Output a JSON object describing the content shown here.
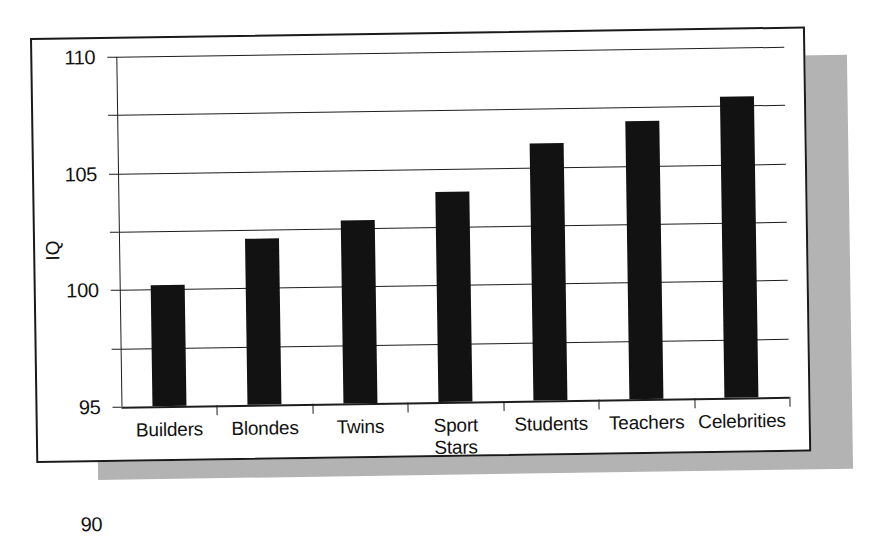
{
  "figure": {
    "frame_color": "#1a1a1a",
    "shadow_color": "#b3b3b3",
    "background": "#ffffff",
    "bar_color": "#121212"
  },
  "chart_data": {
    "type": "bar",
    "title": "",
    "subtitle": "",
    "xlabel": "",
    "ylabel": "IQ",
    "categories": [
      "Builders",
      "Blondes",
      "Twins",
      "Sport\nStars",
      "Students",
      "Teachers",
      "Celebrities"
    ],
    "values": [
      90.4,
      94.2,
      95.7,
      98.0,
      102.0,
      103.8,
      105.8
    ],
    "ylim": [
      80,
      110
    ],
    "yticks": [
      80,
      85,
      90,
      95,
      100,
      105,
      110
    ],
    "ytick_labels": [
      "80",
      "85",
      "90",
      "95",
      "100",
      "105",
      "110"
    ],
    "grid": true,
    "grid_axis": "y",
    "legend": false,
    "legend_position": "none",
    "series": [
      {
        "name": "IQ",
        "values": [
          90.4,
          94.2,
          95.7,
          98.0,
          102.0,
          103.8,
          105.8
        ]
      }
    ]
  }
}
